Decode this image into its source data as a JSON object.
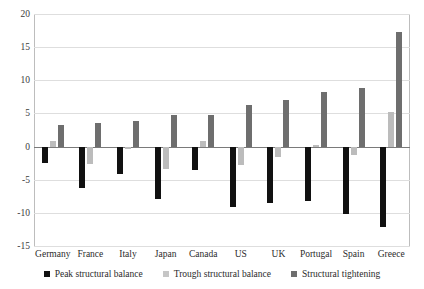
{
  "chart_data": {
    "type": "bar",
    "title": "",
    "subtitle": "",
    "xlabel": "",
    "ylabel": "",
    "ylim": [
      -15,
      20
    ],
    "yticks": [
      20,
      15,
      10,
      5,
      0,
      -5,
      -10,
      -15
    ],
    "ytick_labels": [
      "20",
      "15",
      "10",
      "5",
      "0",
      "-5",
      "-10",
      "-15"
    ],
    "grid": true,
    "legend_position": "bottom",
    "categories": [
      "Germany",
      "France",
      "Italy",
      "Japan",
      "Canada",
      "US",
      "UK",
      "Portugal",
      "Spain",
      "Greece"
    ],
    "series": [
      {
        "name": "Peak structural balance",
        "color": "#111111",
        "values": [
          -2.5,
          -6.2,
          -4.2,
          -7.9,
          -3.5,
          -9.1,
          -8.5,
          -8.2,
          -10.2,
          -12.2
        ]
      },
      {
        "name": "Trough structural balance",
        "color": "#bcbcbc",
        "values": [
          0.8,
          -2.6,
          -0.4,
          -3.4,
          0.9,
          -2.8,
          -1.5,
          0.2,
          -1.3,
          5.2
        ]
      },
      {
        "name": "Structural tightening",
        "color": "#6e6e6e",
        "values": [
          3.3,
          3.6,
          3.8,
          4.7,
          4.8,
          6.3,
          7.1,
          8.2,
          8.9,
          17.3
        ]
      }
    ]
  },
  "legend": {
    "items": [
      {
        "label": "Peak structural balance",
        "swatch": "peak"
      },
      {
        "label": "Trough structural balance",
        "swatch": "trough"
      },
      {
        "label": "Structural tightening",
        "swatch": "tight"
      }
    ]
  }
}
